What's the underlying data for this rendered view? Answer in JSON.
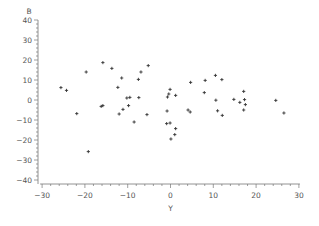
{
  "chart_data": {
    "type": "scatter",
    "title": "",
    "xlabel": "Y",
    "ylabel": "B",
    "xlim": [
      -30,
      30
    ],
    "ylim": [
      -40,
      40
    ],
    "x_ticks": [
      -30,
      -20,
      -10,
      0,
      10,
      20,
      30
    ],
    "y_ticks": [
      40,
      30,
      20,
      10,
      0,
      -10,
      -20,
      -30,
      -40
    ],
    "x_tick_labels": [
      "−30",
      "−20",
      "−10",
      "0",
      "10",
      "20",
      "30"
    ],
    "y_tick_labels": [
      "40",
      "30",
      "20",
      "10",
      "0",
      "−10",
      "−20",
      "−30",
      "−40"
    ],
    "grid": false,
    "legend": null,
    "marker": "+",
    "marker_color": "#333333",
    "points": [
      {
        "x": -25.6,
        "y": 6.2
      },
      {
        "x": -24.3,
        "y": 4.8
      },
      {
        "x": -21.9,
        "y": -6.8
      },
      {
        "x": -19.7,
        "y": 14.0
      },
      {
        "x": -19.2,
        "y": -25.8
      },
      {
        "x": -16.2,
        "y": -3.2
      },
      {
        "x": -15.8,
        "y": -2.8
      },
      {
        "x": -15.8,
        "y": 18.7
      },
      {
        "x": -13.7,
        "y": 15.8
      },
      {
        "x": -12.3,
        "y": 6.3
      },
      {
        "x": -12.0,
        "y": -7.0
      },
      {
        "x": -11.4,
        "y": 11.0
      },
      {
        "x": -11.1,
        "y": -4.7
      },
      {
        "x": -10.2,
        "y": 1.0
      },
      {
        "x": -9.8,
        "y": -2.8
      },
      {
        "x": -9.5,
        "y": 1.3
      },
      {
        "x": -8.5,
        "y": -11.0
      },
      {
        "x": -7.5,
        "y": 10.3
      },
      {
        "x": -7.4,
        "y": 1.2
      },
      {
        "x": -6.9,
        "y": 14.0
      },
      {
        "x": -5.5,
        "y": -7.3
      },
      {
        "x": -5.2,
        "y": 17.2
      },
      {
        "x": -0.9,
        "y": -11.8
      },
      {
        "x": -0.8,
        "y": -5.5
      },
      {
        "x": -0.7,
        "y": 1.5
      },
      {
        "x": -0.4,
        "y": 3.0
      },
      {
        "x": -0.1,
        "y": 5.3
      },
      {
        "x": -0.1,
        "y": -11.5
      },
      {
        "x": 0.1,
        "y": -19.5
      },
      {
        "x": 1.0,
        "y": -17.3
      },
      {
        "x": 1.2,
        "y": 2.3
      },
      {
        "x": 1.2,
        "y": -14.3
      },
      {
        "x": 4.1,
        "y": -5.0
      },
      {
        "x": 4.6,
        "y": -6.0
      },
      {
        "x": 4.7,
        "y": 8.8
      },
      {
        "x": 7.9,
        "y": 3.7
      },
      {
        "x": 8.1,
        "y": 9.8
      },
      {
        "x": 10.5,
        "y": 12.3
      },
      {
        "x": 10.6,
        "y": -0.1
      },
      {
        "x": 11.0,
        "y": -5.4
      },
      {
        "x": 12.0,
        "y": 10.2
      },
      {
        "x": 12.1,
        "y": -7.7
      },
      {
        "x": 14.8,
        "y": 0.3
      },
      {
        "x": 16.2,
        "y": -1.2
      },
      {
        "x": 17.1,
        "y": 4.3
      },
      {
        "x": 17.1,
        "y": -5.0
      },
      {
        "x": 17.3,
        "y": 0.2
      },
      {
        "x": 17.5,
        "y": -2.3
      },
      {
        "x": 24.6,
        "y": -0.2
      },
      {
        "x": 26.5,
        "y": -6.5
      }
    ]
  },
  "layout": {
    "plot_left_px": 38,
    "x_axis_y_px": 184,
    "x0_px": 170.5,
    "x_px_per_unit": 4.28,
    "y0_px": 100,
    "y_px_per_unit": 2
  }
}
